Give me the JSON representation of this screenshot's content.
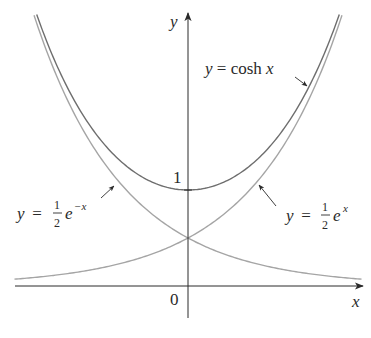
{
  "chart_data": {
    "type": "line",
    "title": "",
    "xlabel": "x",
    "ylabel": "y",
    "xlim": [
      -1.95,
      1.9
    ],
    "ylim": [
      -0.33,
      2.85
    ],
    "grid": false,
    "legend": "inline labels with arrows",
    "ticks": {
      "origin_label": "0",
      "y_tick_label": "1",
      "y_tick_value": 1
    },
    "series": [
      {
        "name": "y = cosh x",
        "formula": "cosh",
        "color": "#6e6e6e",
        "x": [
          -1.7,
          -1.5,
          -1.0,
          -0.5,
          0,
          0.5,
          1.0,
          1.5,
          1.7
        ],
        "values": [
          2.83,
          2.35,
          1.54,
          1.13,
          1.0,
          1.13,
          1.54,
          2.35,
          2.83
        ]
      },
      {
        "name": "y = ½e^x",
        "formula": "half_exp",
        "color": "#a5a5a5",
        "x": [
          -1.95,
          -1.5,
          -1.0,
          -0.5,
          0,
          0.5,
          1.0,
          1.5,
          1.73
        ],
        "values": [
          0.07,
          0.11,
          0.18,
          0.3,
          0.5,
          0.82,
          1.36,
          2.24,
          2.82
        ]
      },
      {
        "name": "y = ½e^−x",
        "formula": "half_exp_neg",
        "color": "#a5a5a5",
        "x": [
          -1.73,
          -1.5,
          -1.0,
          -0.5,
          0,
          0.5,
          1.0,
          1.5,
          1.95
        ],
        "values": [
          2.82,
          2.24,
          1.36,
          0.82,
          0.5,
          0.3,
          0.18,
          0.11,
          0.07
        ]
      }
    ],
    "annotations": [
      {
        "text_main": "y = cosh x",
        "target_series": "cosh"
      },
      {
        "text_main": "y = ",
        "fraction_num": "1",
        "fraction_den": "2",
        "base": "e",
        "exponent": "−x",
        "target_series": "half_exp_neg"
      },
      {
        "text_main": "y = ",
        "fraction_num": "1",
        "fraction_den": "2",
        "base": "e",
        "exponent": "x",
        "target_series": "half_exp"
      }
    ]
  },
  "labels": {
    "y_axis": "y",
    "x_axis": "x",
    "origin": "0",
    "one": "1",
    "cosh": {
      "y": "y",
      "eq": " = cosh ",
      "x": "x"
    },
    "left": {
      "y": "y",
      "eq": " = ",
      "num": "1",
      "den": "2",
      "e": "e",
      "exp": "−x"
    },
    "right": {
      "y": "y",
      "eq": " = ",
      "num": "1",
      "den": "2",
      "e": "e",
      "exp": "x"
    }
  },
  "colors": {
    "axis": "#2a2a2a",
    "cosh": "#6e6e6e",
    "exp": "#a5a5a5",
    "text": "#2a2a2a"
  }
}
